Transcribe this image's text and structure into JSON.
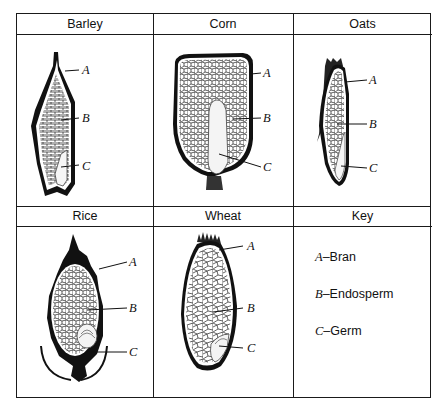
{
  "diagram": {
    "grains": [
      {
        "name": "Barley",
        "labels": [
          "A",
          "B",
          "C"
        ]
      },
      {
        "name": "Corn",
        "labels": [
          "A",
          "B",
          "C"
        ]
      },
      {
        "name": "Oats",
        "labels": [
          "A",
          "B",
          "C"
        ]
      },
      {
        "name": "Rice",
        "labels": [
          "A",
          "B",
          "C"
        ]
      },
      {
        "name": "Wheat",
        "labels": [
          "A",
          "B",
          "C"
        ]
      }
    ],
    "key": {
      "title": "Key",
      "items": [
        {
          "letter": "A",
          "sep": "–",
          "term": "Bran"
        },
        {
          "letter": "B",
          "sep": "–",
          "term": "Endosperm"
        },
        {
          "letter": "C",
          "sep": "–",
          "term": "Germ"
        }
      ]
    },
    "colors": {
      "ink": "#1a1a1a",
      "paper": "#ffffff"
    }
  }
}
